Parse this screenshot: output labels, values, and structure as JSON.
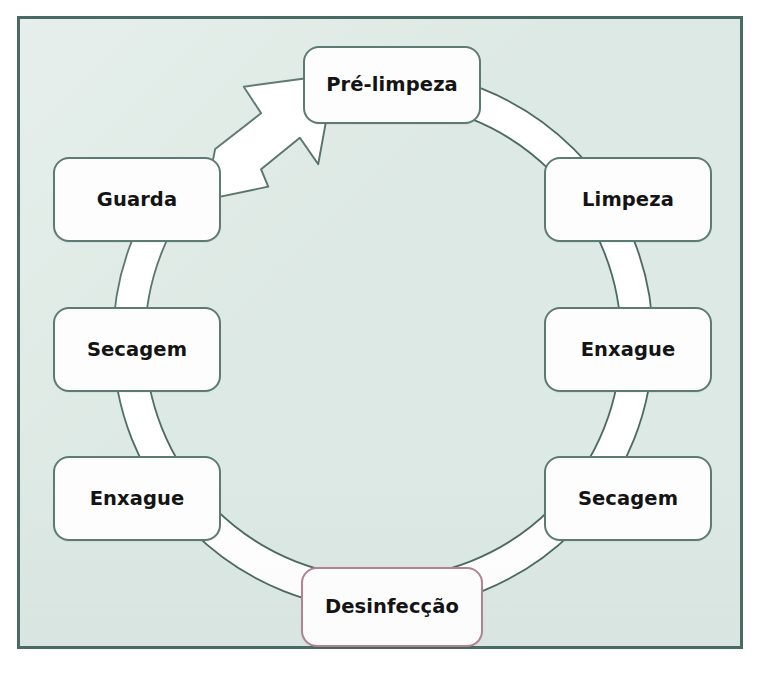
{
  "diagram": {
    "type": "circular-process-cycle",
    "direction": "clockwise",
    "background_color": "#dde9e4",
    "frame_border_color": "#4a6b63",
    "box_border_color": "#5c7b74",
    "highlight_border_color": "#b08292",
    "ring_fill_color": "#ffffff",
    "ring_stroke_color": "#4c6a63",
    "text_color": "#141414"
  },
  "steps": [
    {
      "id": "pre-limpeza",
      "order": 1,
      "label": "Pré-limpeza",
      "position": "top",
      "highlighted": false
    },
    {
      "id": "limpeza",
      "order": 2,
      "label": "Limpeza",
      "position": "upper-right",
      "highlighted": false
    },
    {
      "id": "enxague-1",
      "order": 3,
      "label": "Enxague",
      "position": "right",
      "highlighted": false
    },
    {
      "id": "secagem-1",
      "order": 4,
      "label": "Secagem",
      "position": "lower-right",
      "highlighted": false
    },
    {
      "id": "desinfeccao",
      "order": 5,
      "label": "Desinfecção",
      "position": "bottom",
      "highlighted": true
    },
    {
      "id": "enxague-2",
      "order": 6,
      "label": "Enxague",
      "position": "lower-left",
      "highlighted": false
    },
    {
      "id": "secagem-2",
      "order": 7,
      "label": "Secagem",
      "position": "left",
      "highlighted": false
    },
    {
      "id": "guarda",
      "order": 8,
      "label": "Guarda",
      "position": "upper-left",
      "highlighted": false
    }
  ],
  "arrow": {
    "id": "cycle-arrow",
    "from": "guarda",
    "to": "pre-limpeza",
    "direction": "up-right",
    "fill": "#ffffff",
    "stroke": "#4c6a63"
  }
}
